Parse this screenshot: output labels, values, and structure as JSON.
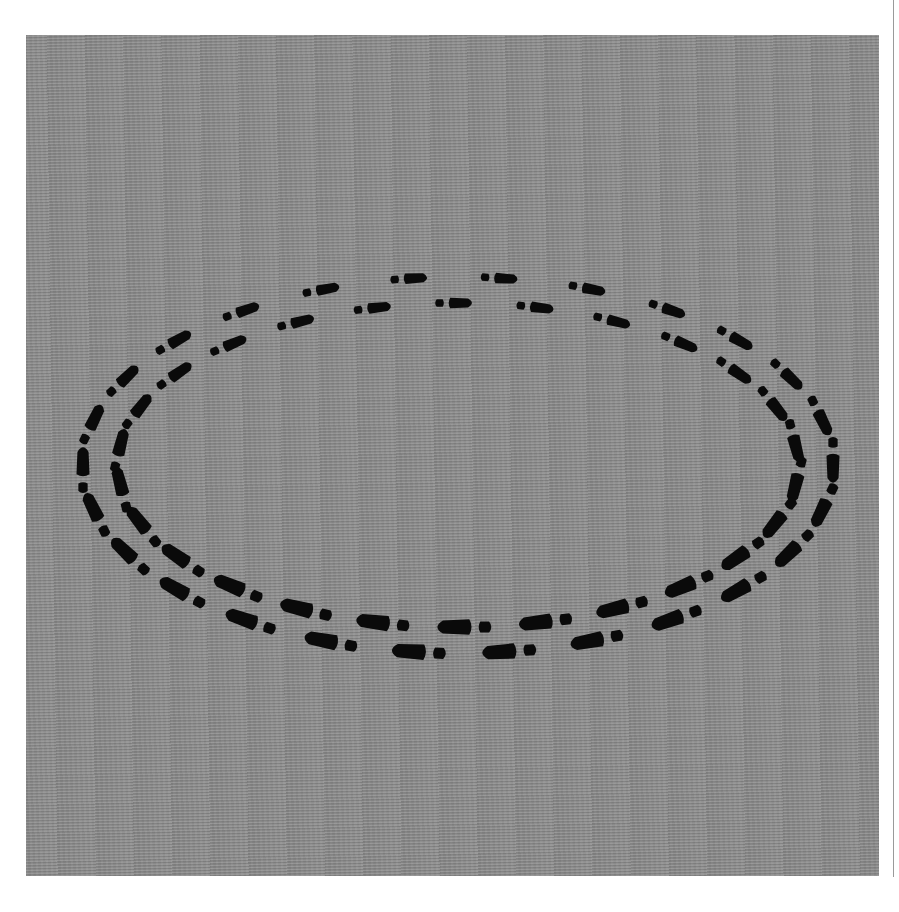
{
  "image": {
    "subject": "shoe prints forming two elliptical loops on gray textured surface",
    "background_color": "#8b8b8b",
    "print_color": "#0a0a0a",
    "ellipse_center": [
      458,
      465
    ],
    "tracks": [
      {
        "name": "outer-track",
        "rx": 375,
        "ry": 188
      },
      {
        "name": "inner-track",
        "rx": 340,
        "ry": 162
      }
    ],
    "prints_per_track": 26
  }
}
